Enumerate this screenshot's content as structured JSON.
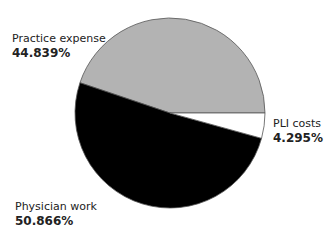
{
  "chart_data": {
    "type": "pie",
    "title": "",
    "slices": [
      {
        "label": "Practice expense",
        "value": 44.839,
        "value_label": "44.839%",
        "color": "#b3b3b3"
      },
      {
        "label": "Physician work",
        "value": 50.866,
        "value_label": "50.866%",
        "color": "#000000"
      },
      {
        "label": "PLI costs",
        "value": 4.295,
        "value_label": "4.295%",
        "color": "#ffffff"
      }
    ],
    "start_angle_deg": 0,
    "direction": "counterclockwise"
  }
}
